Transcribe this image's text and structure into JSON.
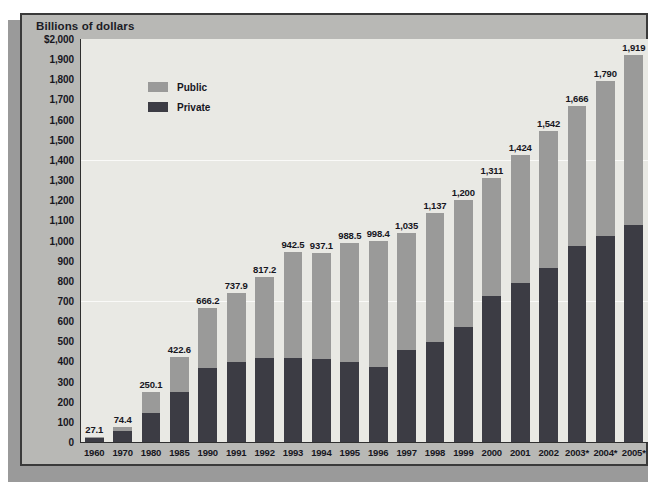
{
  "unit_label": "Billions of dollars",
  "legend": [
    {
      "key": "public",
      "label": "Public",
      "color": "#9a9a99"
    },
    {
      "key": "private",
      "label": "Private",
      "color": "#3c3c44"
    }
  ],
  "colors": {
    "panel_background": "#b8b8b5",
    "plot_background": "#e9e9e4",
    "public_series": "#9a9a99",
    "private_series": "#3c3c44",
    "axis_line": "#2f2f2f",
    "text": "#16161e",
    "gridline": "#ffffff"
  },
  "y_axis": {
    "ticks": [
      "$2,000",
      "1,900",
      "1,800",
      "1,700",
      "1,600",
      "1,500",
      "1,400",
      "1,300",
      "1,200",
      "1,100",
      "1,000",
      "900",
      "800",
      "700",
      "600",
      "500",
      "400",
      "300",
      "200",
      "100",
      "0"
    ],
    "min": 0,
    "max": 2000,
    "step": 100
  },
  "chart_data": {
    "type": "bar",
    "stacked": true,
    "title": "Billions of dollars",
    "xlabel": "",
    "ylabel": "Billions of dollars",
    "ylim": [
      0,
      2000
    ],
    "ystep": 100,
    "grid": true,
    "legend_position": "inside-top-left",
    "categories": [
      "1960",
      "1970",
      "1980",
      "1985",
      "1990",
      "1991",
      "1992",
      "1993",
      "1994",
      "1995",
      "1996",
      "1997",
      "1998",
      "1999",
      "2000",
      "2001",
      "2002",
      "2003*",
      "2004*",
      "2005*"
    ],
    "total_labels": [
      "27.1",
      "74.4",
      "250.1",
      "422.6",
      "666.2",
      "737.9",
      "817.2",
      "942.5",
      "937.1",
      "988.5",
      "998.4",
      "1,035",
      "1,137",
      "1,200",
      "1,311",
      "1,424",
      "1,542",
      "1,666",
      "1,790",
      "1,919"
    ],
    "totals": [
      27.1,
      74.4,
      250.1,
      422.6,
      666.2,
      737.9,
      817.2,
      942.5,
      937.1,
      988.5,
      998.4,
      1035,
      1137,
      1200,
      1311,
      1424,
      1542,
      1666,
      1790,
      1919
    ],
    "series": [
      {
        "name": "Private",
        "color": "#3c3c44",
        "values": [
          20,
          55,
          142,
          248,
          368,
          396,
          416,
          415,
          412,
          396,
          374,
          455,
          495,
          573,
          725,
          788,
          862,
          975,
          1020,
          1075
        ]
      },
      {
        "name": "Public",
        "color": "#9a9a99",
        "values": [
          7.1,
          19.4,
          108.1,
          174.6,
          298.2,
          341.9,
          401.2,
          527.5,
          525.1,
          592.5,
          624.4,
          580,
          642,
          627,
          586,
          636,
          680,
          691,
          770,
          844
        ]
      }
    ]
  }
}
